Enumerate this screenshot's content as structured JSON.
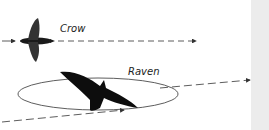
{
  "labels": {
    "crow": "Crow",
    "raven": "Raven"
  },
  "colors": {
    "bird": "#111111",
    "line": "#333333",
    "strip": "#ececec"
  }
}
